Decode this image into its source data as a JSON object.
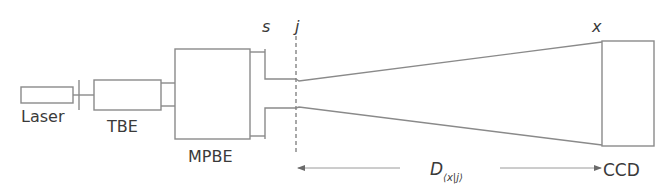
{
  "diagram": {
    "type": "optical-setup-schematic",
    "components": {
      "laser": {
        "label": "Laser"
      },
      "tbe": {
        "label": "TBE"
      },
      "mpbe": {
        "label": "MPBE"
      },
      "ccd": {
        "label": "CCD"
      }
    },
    "planes": {
      "s": {
        "label": "s"
      },
      "j": {
        "label": "j"
      },
      "x": {
        "label": "x"
      }
    },
    "distance": {
      "label_main": "D",
      "label_sub": "⟨x|j⟩"
    },
    "colors": {
      "line": "#8a8a8a",
      "text": "#3a3a3a",
      "background": "#ffffff"
    }
  }
}
